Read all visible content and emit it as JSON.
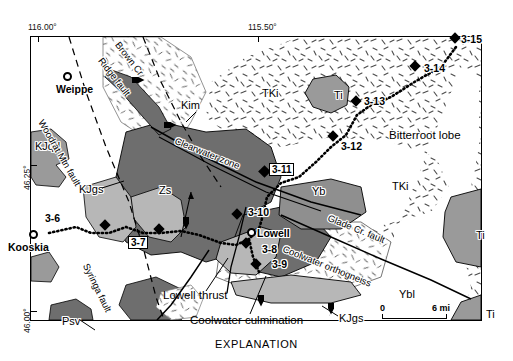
{
  "figure": {
    "caption": "EXPLANATION"
  },
  "graticule": {
    "lon_left": "116.00°",
    "lon_right": "115.50°",
    "lat_top": "46.25°",
    "lat_bottom": "46.00°"
  },
  "scale_bar": {
    "zero": "0",
    "max": "6 mi",
    "length_px": 65
  },
  "towns": [
    {
      "name": "Weippe",
      "x": 63,
      "y": 72
    },
    {
      "name": "Kooskia",
      "x": 29,
      "y": 230
    },
    {
      "name": "Lowell",
      "x": 247,
      "y": 228
    }
  ],
  "map_units": [
    {
      "label": "KJqd",
      "x": 35,
      "y": 141,
      "color": "#9a9a9a"
    },
    {
      "label": "KJgs",
      "x": 79,
      "y": 184,
      "color": "#b7b7b7"
    },
    {
      "label": "KJgs",
      "x": 339,
      "y": 313,
      "color": "#b7b7b7"
    },
    {
      "label": "KJgs",
      "x": 352,
      "y": 288,
      "color": "#b7b7b7"
    },
    {
      "label": "Psv",
      "x": 62,
      "y": 316,
      "color": "#6e6e6e"
    },
    {
      "label": "Zs",
      "x": 159,
      "y": 185,
      "color": "#6e6e6e"
    },
    {
      "label": "Yb",
      "x": 312,
      "y": 186,
      "color": "#8f8f8f"
    },
    {
      "label": "Ybl",
      "x": 399,
      "y": 289,
      "color": "#ffffff"
    },
    {
      "label": "TKi",
      "x": 262,
      "y": 88,
      "color": "#f2f2f2"
    },
    {
      "label": "TKi",
      "x": 392,
      "y": 181,
      "color": "#f2f2f2"
    },
    {
      "label": "Ti",
      "x": 334,
      "y": 90,
      "color": "#9a9a9a"
    },
    {
      "label": "Ti",
      "x": 476,
      "y": 230,
      "color": "#9a9a9a"
    },
    {
      "label": "Ti",
      "x": 486,
      "y": 309,
      "color": "#9a9a9a"
    },
    {
      "label": "Kim",
      "x": 181,
      "y": 108,
      "color": "#ffffff"
    }
  ],
  "fault_labels": [
    {
      "label": "Brown Cr",
      "x": 121,
      "y": 40,
      "rot": 52
    },
    {
      "label": "Ridge fault",
      "x": 104,
      "y": 56,
      "rot": 52
    },
    {
      "label": "Woodrat Mtn fault",
      "x": 45,
      "y": 118,
      "rot": 60
    },
    {
      "label": "Clearwater zone",
      "x": 177,
      "y": 136,
      "rot": 22
    },
    {
      "label": "Syringa fault",
      "x": 90,
      "y": 262,
      "rot": 64
    },
    {
      "label": "Glade Cr. fault",
      "x": 330,
      "y": 213,
      "rot": 22
    },
    {
      "label": "Coolwater orthogneiss",
      "x": 285,
      "y": 244,
      "rot": 22
    }
  ],
  "annotations": [
    {
      "label": "Bitterroot lobe",
      "x": 389,
      "y": 130
    },
    {
      "label": "Lowell thrust",
      "x": 163,
      "y": 290
    },
    {
      "label": "Coolwater culmination",
      "x": 190,
      "y": 315
    }
  ],
  "samples": [
    {
      "id": "3-6",
      "marker_x": 105,
      "marker_y": 225,
      "label_x": 45,
      "label_y": 212,
      "boxed": false
    },
    {
      "id": "3-7",
      "marker_x": 159,
      "marker_y": 229,
      "label_x": 128,
      "label_y": 240,
      "boxed": true
    },
    {
      "id": "3-8",
      "marker_x": 246,
      "marker_y": 243,
      "label_x": 262,
      "label_y": 248,
      "boxed": false
    },
    {
      "id": "3-9",
      "marker_x": 256,
      "marker_y": 264,
      "label_x": 272,
      "label_y": 262,
      "boxed": false
    },
    {
      "id": "3-10",
      "marker_x": 237,
      "marker_y": 214,
      "label_x": 248,
      "label_y": 208,
      "boxed": false
    },
    {
      "id": "3-11",
      "marker_x": 264,
      "marker_y": 171,
      "label_x": 271,
      "label_y": 165,
      "boxed": true
    },
    {
      "id": "3-12",
      "marker_x": 333,
      "marker_y": 136,
      "label_x": 344,
      "label_y": 142,
      "boxed": false
    },
    {
      "id": "3-13",
      "marker_x": 356,
      "marker_y": 101,
      "label_x": 366,
      "label_y": 97,
      "boxed": false
    },
    {
      "id": "3-14",
      "marker_x": 415,
      "marker_y": 66,
      "label_x": 426,
      "label_y": 67,
      "boxed": false
    },
    {
      "id": "3-15",
      "marker_x": 455,
      "marker_y": 38,
      "label_x": 463,
      "label_y": 36,
      "boxed": false
    }
  ],
  "colors": {
    "ink": "#000000",
    "unit_dark": "#6e6e6e",
    "unit_mid": "#8f8f8f",
    "unit_light": "#b7b7b7",
    "stipple_bg": "#ffffff",
    "white": "#ffffff"
  }
}
